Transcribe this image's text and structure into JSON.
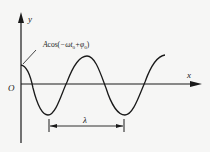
{
  "diagram": {
    "type": "wave-snapshot",
    "axes": {
      "x_label": "x",
      "y_label": "y",
      "origin_label": "O"
    },
    "annotations": {
      "intercept_label_prefix": "A",
      "intercept_label_func": "cos",
      "intercept_label_open": "(",
      "intercept_label_arg1": "−ωt",
      "intercept_label_sub1": "0",
      "intercept_label_plus": "+φ",
      "intercept_label_sub2": "0",
      "intercept_label_close": ")",
      "wavelength_label": "λ"
    },
    "colors": {
      "stroke": "#1a1a1a",
      "background": "#f6f6f5"
    }
  }
}
